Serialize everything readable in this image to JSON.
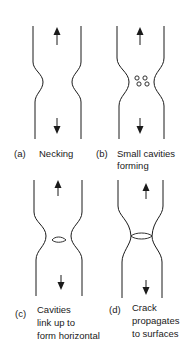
{
  "diagram": {
    "type": "ductile fracture stages",
    "panels": [
      {
        "id": "a",
        "tag": "(a)",
        "caption": [
          "Necking"
        ]
      },
      {
        "id": "b",
        "tag": "(b)",
        "caption": [
          "Small cavities",
          "forming"
        ]
      },
      {
        "id": "c",
        "tag": "(c)",
        "caption": [
          "Cavities",
          "link up to",
          "form horizontal"
        ]
      },
      {
        "id": "d",
        "tag": "(d)",
        "caption": [
          "Crack",
          "propagates",
          "to surfaces"
        ]
      }
    ],
    "colors": {
      "stroke": "#1a1a1a",
      "background": "#ffffff"
    }
  }
}
